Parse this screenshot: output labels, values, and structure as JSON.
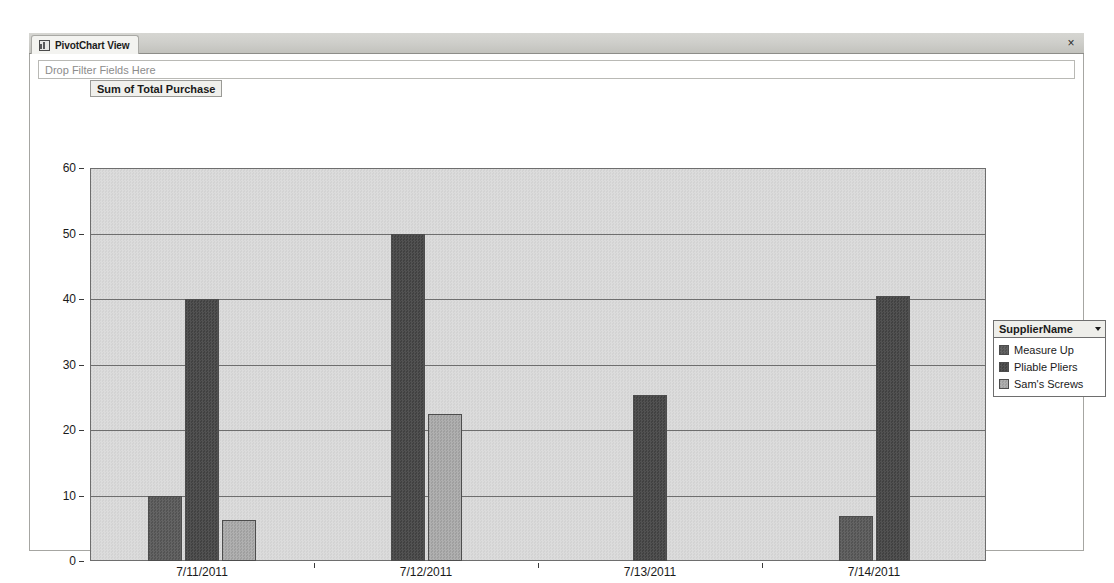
{
  "window": {
    "tab_label": "PivotChart View",
    "tab_icon": "pivotchart-icon",
    "close_label": "×"
  },
  "filter_dropzone": {
    "placeholder": "Drop Filter Fields Here"
  },
  "value_field_button": {
    "label": "Sum of Total Purchase"
  },
  "category_field_button": {
    "label": "PurchaseDate",
    "caret": "▾"
  },
  "legend": {
    "title": "SupplierName",
    "caret": "▾",
    "items": [
      {
        "label": "Measure Up",
        "color": "#5c5c5c"
      },
      {
        "label": "Pliable Pliers",
        "color": "#4a4a4a"
      },
      {
        "label": "Sam's Screws",
        "color": "#a8a8a8"
      }
    ]
  },
  "chart_data": {
    "type": "bar",
    "title": "Sum of Total Purchase",
    "xlabel": "PurchaseDate",
    "ylabel": "Sum of Total Purchase",
    "ylim": [
      0,
      60
    ],
    "yticks": [
      0,
      10,
      20,
      30,
      40,
      50,
      60
    ],
    "grid": true,
    "legend_position": "right",
    "legend_title": "SupplierName",
    "categories": [
      "7/11/2011",
      "7/12/2011",
      "7/13/2011",
      "7/14/2011"
    ],
    "series": [
      {
        "name": "Measure Up",
        "color": "#5c5c5c",
        "values": [
          10.0,
          0,
          0,
          6.8
        ]
      },
      {
        "name": "Pliable Pliers",
        "color": "#4a4a4a",
        "values": [
          40.0,
          50.0,
          25.4,
          40.5
        ]
      },
      {
        "name": "Sam's Screws",
        "color": "#a8a8a8",
        "values": [
          6.3,
          22.4,
          0,
          0
        ]
      }
    ]
  }
}
